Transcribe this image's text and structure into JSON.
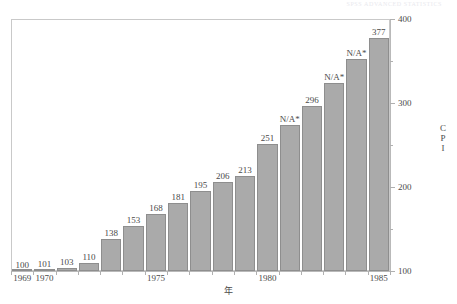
{
  "header": {
    "cropped_text": "SPSS  ADVANCED STATISTICS"
  },
  "chart_data": {
    "type": "bar",
    "title": "",
    "subtitle": "",
    "xlabel": "年",
    "ylabel": "CPI",
    "ylim": [
      100,
      400
    ],
    "grid": false,
    "legend": null,
    "categories": [
      "1969",
      "1970",
      "1971",
      "1972",
      "1973",
      "1974",
      "1975",
      "1976",
      "1977",
      "1978",
      "1979",
      "1980",
      "1981",
      "1982",
      "1983",
      "1984",
      "1985"
    ],
    "values": [
      100,
      101,
      103,
      110,
      138,
      153,
      168,
      181,
      195,
      206,
      213,
      251,
      274,
      296,
      324,
      352,
      377
    ],
    "data_labels": [
      "100",
      "101",
      "103",
      "110",
      "138",
      "153",
      "168",
      "181",
      "195",
      "206",
      "213",
      "251",
      "N/A*",
      "296",
      "N/A*",
      "N/A*",
      "377"
    ],
    "bar_color": "#aaaaaa",
    "bar_border_color": "#8e8e8e",
    "y_major_ticks": [
      "100",
      "200",
      "300",
      "400"
    ],
    "y_major_values": [
      100,
      200,
      300,
      400
    ],
    "y_minor_values": [
      150,
      250,
      350
    ],
    "x_tick_labels": [
      "1969",
      "1970",
      "1975",
      "1980",
      "1985"
    ],
    "x_tick_categories": [
      "1969",
      "1970",
      "1975",
      "1980",
      "1985"
    ]
  }
}
